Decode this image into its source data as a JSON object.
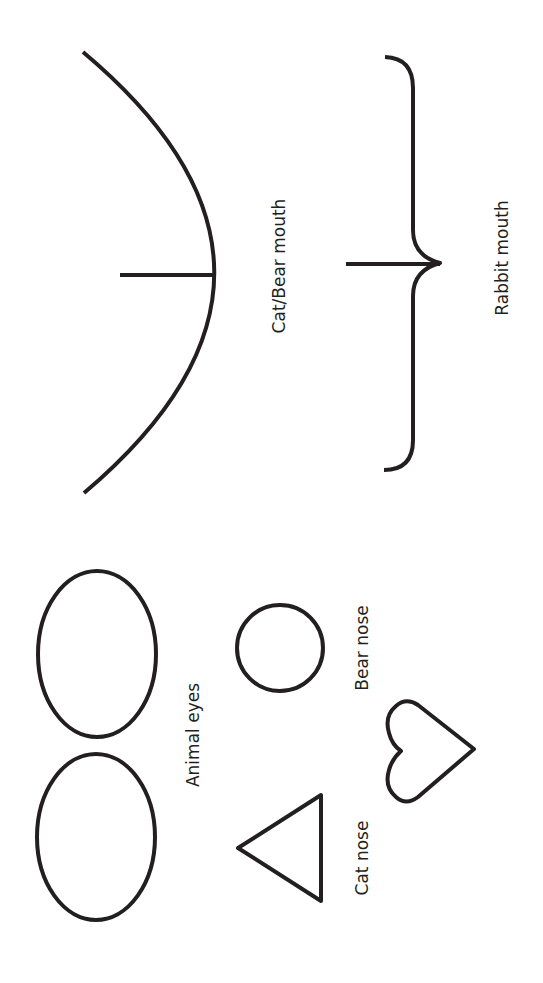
{
  "template": {
    "stroke_color": "#231f20",
    "background": "#ffffff",
    "mouths": {
      "cat_bear": {
        "label": "Cat/Bear mouth",
        "shape": "arc-with-center-line"
      },
      "rabbit": {
        "label": "Rabbit mouth",
        "shape": "curly-brace-with-center-line"
      }
    },
    "eyes": {
      "label": "Animal eyes",
      "shape": "oval",
      "count": 2
    },
    "noses": {
      "bear": {
        "label": "Bear nose",
        "shape": "circle"
      },
      "cat": {
        "label": "Cat nose",
        "shape": "triangle"
      },
      "heart": {
        "label": "",
        "shape": "heart"
      }
    }
  }
}
